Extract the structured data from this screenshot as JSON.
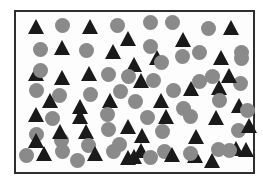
{
  "figure": {
    "type": "mixed shape field inside rectangle",
    "frame": {
      "x": 14,
      "y": 10,
      "width": 237,
      "height": 160,
      "border_color": "#2e2e2e",
      "background": "#fdfdfd"
    },
    "colors": {
      "circle": "#8a8a8a",
      "triangle": "#1a1a1a"
    },
    "sizes": {
      "circle_diameter": 15,
      "triangle_base": 16,
      "triangle_height": 15
    },
    "counts": {
      "circles": 48,
      "triangles": 44
    },
    "shapes": [
      {
        "type": "triangle",
        "x": 36,
        "y": 26
      },
      {
        "type": "circle",
        "x": 62,
        "y": 25
      },
      {
        "type": "triangle",
        "x": 90,
        "y": 26
      },
      {
        "type": "circle",
        "x": 117,
        "y": 25
      },
      {
        "type": "circle",
        "x": 150,
        "y": 22
      },
      {
        "type": "circle",
        "x": 172,
        "y": 22
      },
      {
        "type": "circle",
        "x": 208,
        "y": 28
      },
      {
        "type": "triangle",
        "x": 231,
        "y": 27
      },
      {
        "type": "triangle",
        "x": 128,
        "y": 38
      },
      {
        "type": "triangle",
        "x": 183,
        "y": 39
      },
      {
        "type": "circle",
        "x": 40,
        "y": 49
      },
      {
        "type": "triangle",
        "x": 62,
        "y": 47
      },
      {
        "type": "circle",
        "x": 86,
        "y": 50
      },
      {
        "type": "triangle",
        "x": 113,
        "y": 51
      },
      {
        "type": "circle",
        "x": 150,
        "y": 46
      },
      {
        "type": "triangle",
        "x": 157,
        "y": 57
      },
      {
        "type": "circle",
        "x": 199,
        "y": 52
      },
      {
        "type": "triangle",
        "x": 221,
        "y": 57
      },
      {
        "type": "circle",
        "x": 241,
        "y": 52
      },
      {
        "type": "triangle",
        "x": 36,
        "y": 73
      },
      {
        "type": "triangle",
        "x": 62,
        "y": 77
      },
      {
        "type": "triangle",
        "x": 89,
        "y": 73
      },
      {
        "type": "circle",
        "x": 108,
        "y": 74
      },
      {
        "type": "triangle",
        "x": 134,
        "y": 64
      },
      {
        "type": "triangle",
        "x": 141,
        "y": 80
      },
      {
        "type": "circle",
        "x": 161,
        "y": 62
      },
      {
        "type": "circle",
        "x": 182,
        "y": 56
      },
      {
        "type": "triangle",
        "x": 219,
        "y": 87
      },
      {
        "type": "circle",
        "x": 199,
        "y": 81
      },
      {
        "type": "circle",
        "x": 241,
        "y": 58
      },
      {
        "type": "circle",
        "x": 153,
        "y": 80
      },
      {
        "type": "circle",
        "x": 36,
        "y": 90
      },
      {
        "type": "circle",
        "x": 59,
        "y": 95
      },
      {
        "type": "circle",
        "x": 90,
        "y": 94
      },
      {
        "type": "circle",
        "x": 120,
        "y": 91
      },
      {
        "type": "triangle",
        "x": 50,
        "y": 100
      },
      {
        "type": "triangle",
        "x": 80,
        "y": 106
      },
      {
        "type": "triangle",
        "x": 110,
        "y": 100
      },
      {
        "type": "circle",
        "x": 135,
        "y": 101
      },
      {
        "type": "triangle",
        "x": 161,
        "y": 100
      },
      {
        "type": "circle",
        "x": 183,
        "y": 108
      },
      {
        "type": "circle",
        "x": 219,
        "y": 100
      },
      {
        "type": "triangle",
        "x": 239,
        "y": 105
      },
      {
        "type": "triangle",
        "x": 191,
        "y": 88
      },
      {
        "type": "triangle",
        "x": 216,
        "y": 117
      },
      {
        "type": "triangle",
        "x": 36,
        "y": 114
      },
      {
        "type": "circle",
        "x": 52,
        "y": 118
      },
      {
        "type": "triangle",
        "x": 80,
        "y": 116
      },
      {
        "type": "circle",
        "x": 107,
        "y": 114
      },
      {
        "type": "triangle",
        "x": 128,
        "y": 126
      },
      {
        "type": "circle",
        "x": 147,
        "y": 117
      },
      {
        "type": "triangle",
        "x": 166,
        "y": 116
      },
      {
        "type": "circle",
        "x": 190,
        "y": 116
      },
      {
        "type": "triangle",
        "x": 196,
        "y": 136
      },
      {
        "type": "circle",
        "x": 238,
        "y": 130
      },
      {
        "type": "circle",
        "x": 162,
        "y": 131
      },
      {
        "type": "triangle",
        "x": 142,
        "y": 135
      },
      {
        "type": "triangle",
        "x": 86,
        "y": 131
      },
      {
        "type": "circle",
        "x": 108,
        "y": 129
      },
      {
        "type": "circle",
        "x": 36,
        "y": 134
      },
      {
        "type": "circle",
        "x": 61,
        "y": 140
      },
      {
        "type": "triangle",
        "x": 60,
        "y": 131
      },
      {
        "type": "triangle",
        "x": 36,
        "y": 140
      },
      {
        "type": "circle",
        "x": 88,
        "y": 145
      },
      {
        "type": "circle",
        "x": 119,
        "y": 144
      },
      {
        "type": "triangle",
        "x": 141,
        "y": 150
      },
      {
        "type": "circle",
        "x": 164,
        "y": 151
      },
      {
        "type": "triangle",
        "x": 195,
        "y": 155
      },
      {
        "type": "circle",
        "x": 218,
        "y": 149
      },
      {
        "type": "triangle",
        "x": 236,
        "y": 148
      },
      {
        "type": "circle",
        "x": 247,
        "y": 110
      },
      {
        "type": "triangle",
        "x": 249,
        "y": 125
      },
      {
        "type": "circle",
        "x": 26,
        "y": 155
      },
      {
        "type": "triangle",
        "x": 44,
        "y": 153
      },
      {
        "type": "circle",
        "x": 62,
        "y": 151
      },
      {
        "type": "circle",
        "x": 77,
        "y": 160
      },
      {
        "type": "triangle",
        "x": 95,
        "y": 153
      },
      {
        "type": "circle",
        "x": 113,
        "y": 151
      },
      {
        "type": "triangle",
        "x": 128,
        "y": 157
      },
      {
        "type": "triangle",
        "x": 134,
        "y": 156
      },
      {
        "type": "circle",
        "x": 150,
        "y": 157
      },
      {
        "type": "triangle",
        "x": 172,
        "y": 154
      },
      {
        "type": "circle",
        "x": 190,
        "y": 153
      },
      {
        "type": "triangle",
        "x": 212,
        "y": 160
      },
      {
        "type": "circle",
        "x": 229,
        "y": 150
      },
      {
        "type": "triangle",
        "x": 246,
        "y": 149
      },
      {
        "type": "circle",
        "x": 212,
        "y": 76
      },
      {
        "type": "circle",
        "x": 240,
        "y": 83
      },
      {
        "type": "triangle",
        "x": 229,
        "y": 75
      },
      {
        "type": "circle",
        "x": 173,
        "y": 90
      },
      {
        "type": "circle",
        "x": 128,
        "y": 76
      },
      {
        "type": "circle",
        "x": 40,
        "y": 70
      }
    ]
  }
}
